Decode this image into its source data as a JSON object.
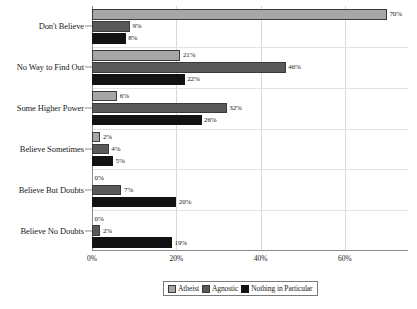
{
  "chart_data": {
    "type": "bar",
    "orientation": "horizontal",
    "title": "",
    "xlabel": "",
    "ylabel": "",
    "xlim": [
      0,
      75
    ],
    "grid": "vertical",
    "legend_position": "bottom",
    "xticks": [
      "0%",
      "20%",
      "40%",
      "60%"
    ],
    "xtick_values": [
      0,
      20,
      40,
      60
    ],
    "categories": [
      "Don't Believe",
      "No Way to Find Out",
      "Some Higher Power",
      "Believe Sometimes",
      "Believe But Doubts",
      "Believe No Doubts"
    ],
    "series": [
      {
        "name": "Atheist",
        "color": "#a6a6a6",
        "values": [
          70,
          21,
          6,
          2,
          0,
          0
        ],
        "labels": [
          "70%",
          "21%",
          "6%",
          "2%",
          "0%",
          "0%"
        ]
      },
      {
        "name": "Agnostic",
        "color": "#595959",
        "values": [
          9,
          46,
          32,
          4,
          7,
          2
        ],
        "labels": [
          "9%",
          "46%",
          "32%",
          "4%",
          "7%",
          "2%"
        ]
      },
      {
        "name": "Nothing in Particular",
        "color": "#121212",
        "values": [
          8,
          22,
          26,
          5,
          20,
          19
        ],
        "labels": [
          "8%",
          "22%",
          "26%",
          "5%",
          "20%",
          "19%"
        ]
      }
    ]
  }
}
